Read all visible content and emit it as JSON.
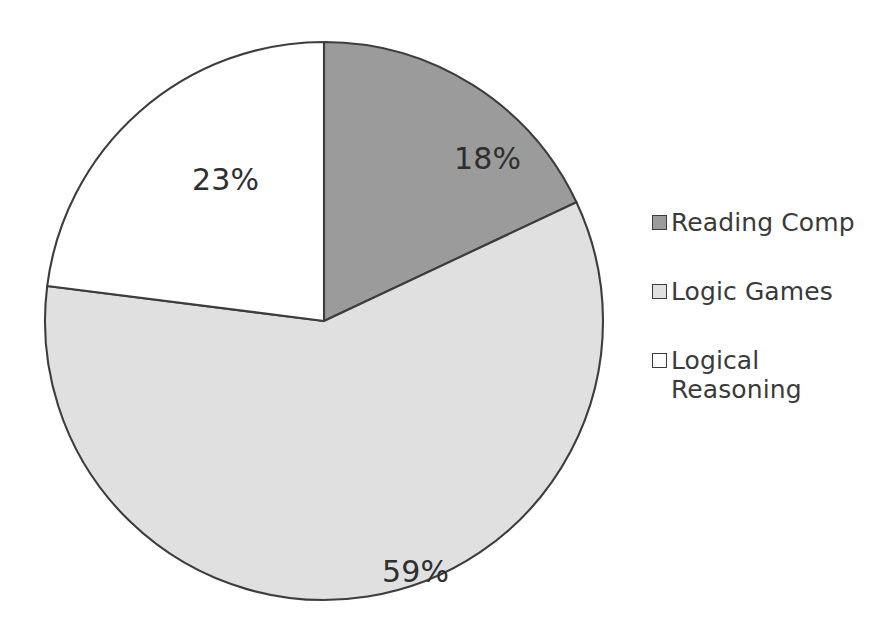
{
  "chart_data": {
    "type": "pie",
    "title": "",
    "subtitle": "",
    "xlabel": "",
    "ylabel": "",
    "grid": false,
    "legend_position": "right",
    "start_angle_deg": 90,
    "direction": "clockwise",
    "unit": "%",
    "categories": [
      "Reading Comp",
      "Logic Games",
      "Logical Reasoning"
    ],
    "values": [
      18,
      59,
      23
    ],
    "data_labels": [
      "18%",
      "59%",
      "23%"
    ],
    "colors": [
      "#9b9b9b",
      "#e0e0e0",
      "#ffffff"
    ],
    "slice_border_color": "#3d3d3d",
    "slices": [
      {
        "label": "Reading Comp",
        "value": 18,
        "data_label": "18%",
        "color": "#9b9b9b",
        "start_deg": 0,
        "sweep_deg": 64.8
      },
      {
        "label": "Logic Games",
        "value": 59,
        "data_label": "59%",
        "color": "#e0e0e0",
        "start_deg": 64.8,
        "sweep_deg": 212.4
      },
      {
        "label": "Logical Reasoning",
        "value": 23,
        "data_label": "23%",
        "color": "#ffffff",
        "start_deg": 277.2,
        "sweep_deg": 82.8
      }
    ]
  },
  "labels": {
    "reading_comp_pct": "18%",
    "logic_games_pct": "59%",
    "logical_reasoning_pct": "23%"
  },
  "legend": {
    "items": [
      {
        "label": "Reading Comp",
        "color": "#9b9b9b"
      },
      {
        "label": "Logic Games",
        "color": "#e0e0e0"
      },
      {
        "label": "Logical Reasoning",
        "color": "#ffffff"
      }
    ]
  }
}
